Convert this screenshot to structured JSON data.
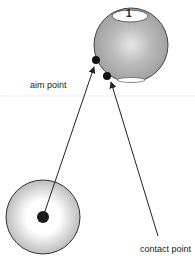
{
  "diagram": {
    "labels": {
      "aim": "aim point",
      "contact": "contact point",
      "object_ball_number": "1"
    },
    "colors": {
      "object_ball": "#a8a8a8",
      "cue_ball": "#d8d8d8",
      "line": "#222222",
      "dot": "#111111",
      "divider": "#eeeeee"
    }
  }
}
